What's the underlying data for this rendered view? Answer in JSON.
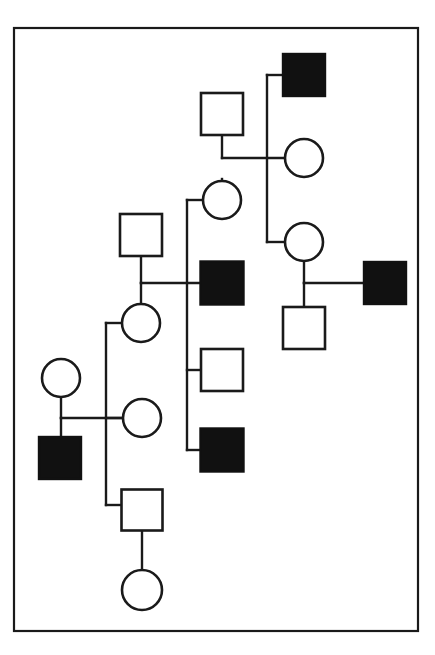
{
  "figure": {
    "kind": "pedigree-chart",
    "title": "",
    "background_color": "#ffffff",
    "stroke_color": "#1a1a1a",
    "affected_fill": "#111111",
    "unaffected_fill": "#ffffff",
    "border": {
      "x": 14,
      "y": 28,
      "width": 404,
      "height": 603,
      "stroke_width": 2.2
    },
    "legend": {
      "filled_square_meaning": "affected male",
      "open_square_meaning": "unaffected male",
      "open_circle_meaning": "unaffected female",
      "filled_circle_meaning": "affected female"
    }
  },
  "symbols": [
    {
      "id": "m-top-right",
      "shape": "square",
      "sex": "male",
      "status": "affected",
      "fill": "#111111",
      "cx": 304,
      "cy": 75,
      "size": 42
    },
    {
      "id": "m-gen1-left",
      "shape": "square",
      "sex": "male",
      "status": "unaffected",
      "fill": "#ffffff",
      "cx": 222,
      "cy": 114,
      "size": 42
    },
    {
      "id": "f-gen2-upper-right",
      "shape": "circle",
      "sex": "female",
      "status": "unaffected",
      "fill": "#ffffff",
      "cx": 304,
      "cy": 158,
      "r": 19
    },
    {
      "id": "f-gen2-center",
      "shape": "circle",
      "sex": "female",
      "status": "unaffected",
      "fill": "#ffffff",
      "cx": 222,
      "cy": 200,
      "r": 19
    },
    {
      "id": "m-gen2-left",
      "shape": "square",
      "sex": "male",
      "status": "unaffected",
      "fill": "#ffffff",
      "cx": 141,
      "cy": 235,
      "size": 42
    },
    {
      "id": "f-gen3-right",
      "shape": "circle",
      "sex": "female",
      "status": "unaffected",
      "fill": "#ffffff",
      "cx": 304,
      "cy": 242,
      "r": 19
    },
    {
      "id": "m-center-affected-upper",
      "shape": "square",
      "sex": "male",
      "status": "affected",
      "fill": "#111111",
      "cx": 222,
      "cy": 283,
      "size": 43
    },
    {
      "id": "m-right-affected",
      "shape": "square",
      "sex": "male",
      "status": "affected",
      "fill": "#111111",
      "cx": 385,
      "cy": 283,
      "size": 42
    },
    {
      "id": "f-gen3-left",
      "shape": "circle",
      "sex": "female",
      "status": "unaffected",
      "fill": "#ffffff",
      "cx": 141,
      "cy": 323,
      "r": 19
    },
    {
      "id": "m-right-child",
      "shape": "square",
      "sex": "male",
      "status": "unaffected",
      "fill": "#ffffff",
      "cx": 304,
      "cy": 328,
      "size": 42
    },
    {
      "id": "m-center-open",
      "shape": "square",
      "sex": "male",
      "status": "unaffected",
      "fill": "#ffffff",
      "cx": 222,
      "cy": 370,
      "size": 42
    },
    {
      "id": "f-gen4-far-left",
      "shape": "circle",
      "sex": "female",
      "status": "unaffected",
      "fill": "#ffffff",
      "cx": 61,
      "cy": 378,
      "r": 19
    },
    {
      "id": "f-gen4-left",
      "shape": "circle",
      "sex": "female",
      "status": "unaffected",
      "fill": "#ffffff",
      "cx": 142,
      "cy": 418,
      "r": 19
    },
    {
      "id": "m-center-affected-lower",
      "shape": "square",
      "sex": "male",
      "status": "affected",
      "fill": "#111111",
      "cx": 222,
      "cy": 450,
      "size": 43
    },
    {
      "id": "m-bottom-left-affected",
      "shape": "square",
      "sex": "male",
      "status": "affected",
      "fill": "#111111",
      "cx": 60,
      "cy": 458,
      "size": 42
    },
    {
      "id": "m-bottom-center",
      "shape": "square",
      "sex": "male",
      "status": "unaffected",
      "fill": "#ffffff",
      "cx": 142,
      "cy": 510,
      "size": 41
    },
    {
      "id": "f-bottom-proband",
      "shape": "circle",
      "sex": "female",
      "status": "unaffected",
      "fill": "#ffffff",
      "cx": 142,
      "cy": 590,
      "r": 20
    }
  ],
  "connectors": [
    {
      "id": "drop-m-gen1-left",
      "type": "descent",
      "points": "222,135 222,158"
    },
    {
      "id": "mating-gen1",
      "type": "mating",
      "points": "222,158 285,158"
    },
    {
      "id": "sib-right-vertical",
      "type": "sibship",
      "points": "267,75 267,242"
    },
    {
      "id": "sib-right-to-affected-top",
      "type": "sibship-stub",
      "points": "267,75 283,75"
    },
    {
      "id": "sib-right-to-circle2",
      "type": "sibship-stub",
      "points": "267,242 285,242"
    },
    {
      "id": "drop-f-gen2-center",
      "type": "descent",
      "points": "222,179 222,200"
    },
    {
      "id": "sib-center-vertical",
      "type": "sibship",
      "points": "187,200 187,450"
    },
    {
      "id": "sib-center-stub-top",
      "type": "sibship-stub",
      "points": "187,200 203,200"
    },
    {
      "id": "sib-center-stub-open",
      "type": "sibship-stub",
      "points": "187,370 201,370"
    },
    {
      "id": "sib-center-stub-lower",
      "type": "sibship-stub",
      "points": "187,450 200,450"
    },
    {
      "id": "drop-m-gen2-left",
      "type": "descent",
      "points": "141,256 141,283"
    },
    {
      "id": "mating-gen2",
      "type": "mating",
      "points": "141,283 200,283"
    },
    {
      "id": "descent-to-f-gen3-left",
      "type": "descent",
      "points": "141,283 141,304"
    },
    {
      "id": "drop-f-gen3-right",
      "type": "descent",
      "points": "304,261 304,283"
    },
    {
      "id": "mating-right",
      "type": "mating",
      "points": "304,283 365,283"
    },
    {
      "id": "descent-right-child",
      "type": "descent",
      "points": "304,283 304,307"
    },
    {
      "id": "sib-left-vertical",
      "type": "sibship",
      "points": "106,323 106,505"
    },
    {
      "id": "sib-left-stub-circle1",
      "type": "sibship-stub",
      "points": "106,323 122,323"
    },
    {
      "id": "sib-left-stub-circle2",
      "type": "sibship-stub",
      "points": "106,418 123,418"
    },
    {
      "id": "sib-left-stub-square",
      "type": "sibship-stub",
      "points": "106,505 122,505"
    },
    {
      "id": "drop-f-gen4-far-left",
      "type": "descent",
      "points": "61,397 61,418"
    },
    {
      "id": "mating-bottom-left",
      "type": "mating",
      "points": "61,418 123,418"
    },
    {
      "id": "descent-bottom-left-affected",
      "type": "descent",
      "points": "61,418 61,437"
    },
    {
      "id": "drop-m-bottom-center",
      "type": "descent",
      "points": "142,531 142,570"
    }
  ]
}
